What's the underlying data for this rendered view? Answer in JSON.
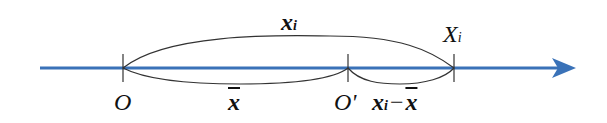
{
  "diagram": {
    "axis_color": "#3a72b8",
    "arc_color": "#333333",
    "points": [
      {
        "id": "O",
        "label": "O"
      },
      {
        "id": "O_prime",
        "label": "O'"
      },
      {
        "id": "X_i",
        "label": "X",
        "subscript": "i"
      }
    ],
    "arcs": [
      {
        "from": "O",
        "to": "X_i",
        "label": "x",
        "subscript": "i",
        "position": "above"
      },
      {
        "from": "O",
        "to": "O_prime",
        "label": "x",
        "overline": true,
        "position": "below"
      },
      {
        "from": "O_prime",
        "to": "X_i",
        "label_main": "x",
        "label_sub": "i",
        "label_op": "−",
        "label_bar": "x",
        "position": "below"
      }
    ]
  }
}
